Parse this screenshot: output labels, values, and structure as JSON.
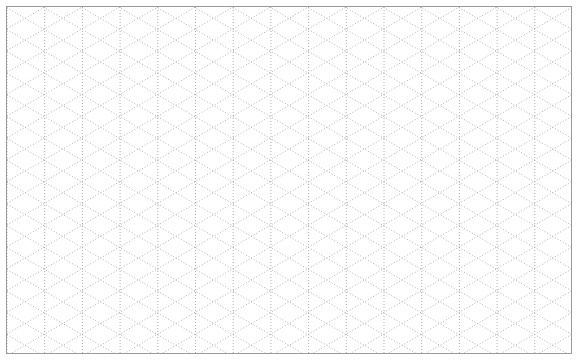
{
  "document": {
    "kind": "isometric-dot-grid-paper",
    "title": "Isometric Dotted Grid",
    "width_px": 581,
    "height_px": 364,
    "background_color": "#ffffff"
  },
  "frame": {
    "visible": true,
    "inset_left_px": 6,
    "inset_top_px": 6,
    "width_px": 566,
    "height_px": 348,
    "border_width_px": 1,
    "border_color": "#9a9a9a",
    "fill_color": "#ffffff"
  },
  "grid": {
    "type": "isometric-triangular",
    "style": "dotted",
    "dot_color": "#b0b0b0",
    "dot_color_dark": "#8f8f8f",
    "line_width_px": 1,
    "dash_on_px": 1,
    "dash_off_px": 2,
    "column_spacing_px": 37.7,
    "row_spacing_px": 21.8,
    "diagonal_angle_deg": 30,
    "vertical_lines": true,
    "diagonal_lines_up": true,
    "diagonal_lines_down": true,
    "column_count": 16,
    "row_count": 17
  },
  "labels": {
    "has_text": false,
    "has_axis_ticks": false,
    "has_legend": false
  }
}
